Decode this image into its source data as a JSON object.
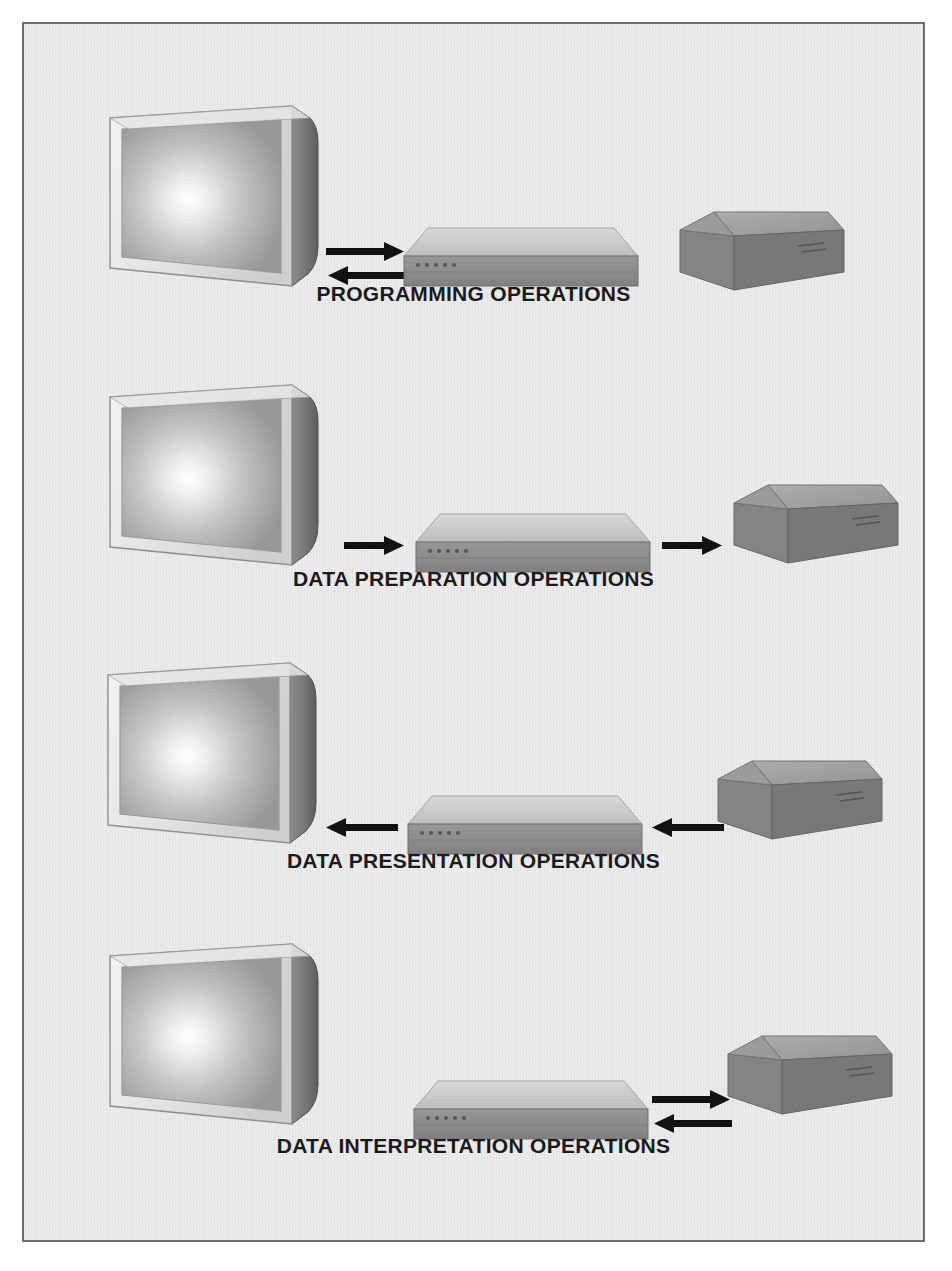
{
  "figure": {
    "background_color": "#e9e9e9",
    "border_color": "#6e6e6e",
    "rows": [
      {
        "id": "programming-operations",
        "label": "PROGRAMMING OPERATIONS",
        "monitor": {
          "name": "monitor",
          "present": true
        },
        "cpu": {
          "name": "cpu",
          "present": true
        },
        "disk": {
          "name": "disk",
          "present": true
        },
        "arrows_left_gap": {
          "type": "bidirectional",
          "directions": [
            "right",
            "left"
          ]
        },
        "arrows_right_gap": {
          "type": "none",
          "directions": []
        }
      },
      {
        "id": "data-preparation-operations",
        "label": "DATA PREPARATION OPERATIONS",
        "monitor": {
          "name": "monitor",
          "present": true
        },
        "cpu": {
          "name": "cpu",
          "present": true
        },
        "disk": {
          "name": "disk",
          "present": true
        },
        "arrows_left_gap": {
          "type": "single",
          "directions": [
            "right"
          ]
        },
        "arrows_right_gap": {
          "type": "single",
          "directions": [
            "right"
          ]
        }
      },
      {
        "id": "data-presentation-operations",
        "label": "DATA PRESENTATION OPERATIONS",
        "monitor": {
          "name": "monitor",
          "present": true
        },
        "cpu": {
          "name": "cpu",
          "present": true
        },
        "disk": {
          "name": "disk",
          "present": true
        },
        "arrows_left_gap": {
          "type": "single",
          "directions": [
            "left"
          ]
        },
        "arrows_right_gap": {
          "type": "single",
          "directions": [
            "left"
          ]
        }
      },
      {
        "id": "data-interpretation-operations",
        "label": "DATA INTERPRETATION OPERATIONS",
        "monitor": {
          "name": "monitor",
          "present": true
        },
        "cpu": {
          "name": "cpu",
          "present": true
        },
        "disk": {
          "name": "disk",
          "present": true
        },
        "arrows_left_gap": {
          "type": "none",
          "directions": []
        },
        "arrows_right_gap": {
          "type": "bidirectional",
          "directions": [
            "right",
            "left"
          ]
        }
      }
    ],
    "colors": {
      "arrow": "#121212",
      "label_text": "#1a1a1a",
      "monitor_bezel_light": "#dcdcdc",
      "monitor_screen_glow": "#ffffff",
      "monitor_side_dark": "#6b6b6b",
      "cpu_top_light": "#c9c9c9",
      "cpu_front_dark": "#8a8a8a",
      "disk_top_light": "#a5a5a5",
      "disk_side_dark": "#7a7a7a"
    }
  }
}
